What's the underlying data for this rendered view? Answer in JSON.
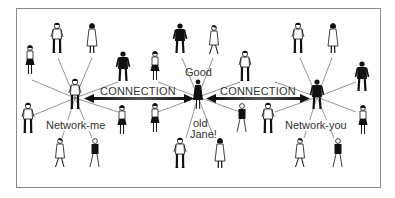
{
  "diagram": {
    "type": "social-network-illustration",
    "connection_label_left": "CONNECTION",
    "connection_label_right": "CONNECTION",
    "hubs": {
      "left": {
        "label": "Network-me",
        "x": 75,
        "y": 98
      },
      "center": {
        "label_top": "Good",
        "label_bottom_1": "old",
        "label_bottom_2": "Jane!",
        "x": 198,
        "y": 97
      },
      "right": {
        "label": "Network-you",
        "x": 317,
        "y": 97
      }
    },
    "colors": {
      "line": "#555555",
      "figure_dark": "#1a1a1a",
      "figure_light": "#ffffff",
      "border": "#8a8a8a",
      "text": "#333333"
    }
  }
}
